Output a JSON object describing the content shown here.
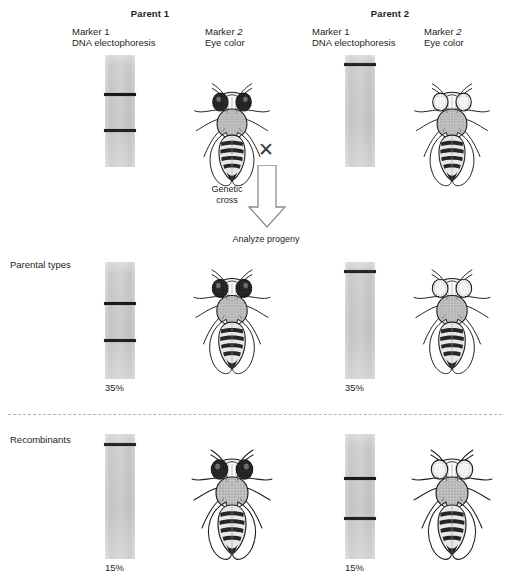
{
  "figure": {
    "title_parent_1": "Parent 1",
    "title_parent_2": "Parent 2",
    "marker1_line1": "Marker 1",
    "marker1_line2": "DNA electophoresis",
    "marker2_line1": "Marker ",
    "marker2_line1_em": "2",
    "marker2_line2": "Eye color",
    "cross_symbol": "✕",
    "arrow_label_line1": "Genetic",
    "arrow_label_line2": "cross",
    "analyze_label": "Analyze progeny",
    "row_parental": "Parental types",
    "row_recombinants": "Recombinants"
  },
  "colors": {
    "gel_fill": "#cfcfcf",
    "band": "#1a1a1a",
    "text": "#231f20",
    "divider": "#9a9a9a",
    "eye_dark": "#2b2b2b",
    "eye_light": "#f2f2f2"
  },
  "lanes": {
    "parent1": {
      "name": "parent-1-gel",
      "percent": "",
      "bands": [
        34,
        66
      ],
      "eye": "dark"
    },
    "parent2": {
      "name": "parent-2-gel",
      "percent": "",
      "bands": [
        7
      ],
      "eye": "light"
    },
    "parental_left": {
      "name": "parental-left-gel",
      "percent": "35%",
      "bands": [
        34,
        66
      ],
      "eye": "dark"
    },
    "parental_right": {
      "name": "parental-right-gel",
      "percent": "35%",
      "bands": [
        7
      ],
      "eye": "light"
    },
    "recombinant_left": {
      "name": "recombinant-left-gel",
      "percent": "15%",
      "bands": [
        7
      ],
      "eye": "dark"
    },
    "recombinant_right": {
      "name": "recombinant-right-gel",
      "percent": "15%",
      "bands": [
        34,
        66
      ],
      "eye": "light"
    }
  },
  "chart_data": {
    "type": "diagram",
    "categories": [
      "Parental types",
      "Recombinants"
    ],
    "values": [
      70,
      30
    ],
    "detail": [
      {
        "class": "Parental types",
        "column": "left",
        "percent": 35,
        "marker1_bands": 2,
        "eye_color": "dark"
      },
      {
        "class": "Parental types",
        "column": "right",
        "percent": 35,
        "marker1_bands": 1,
        "eye_color": "light"
      },
      {
        "class": "Recombinants",
        "column": "left",
        "percent": 15,
        "marker1_bands": 1,
        "eye_color": "dark"
      },
      {
        "class": "Recombinants",
        "column": "right",
        "percent": 15,
        "marker1_bands": 2,
        "eye_color": "light"
      }
    ],
    "ylabel": "Percent of progeny",
    "xlabel": "Progeny class"
  }
}
